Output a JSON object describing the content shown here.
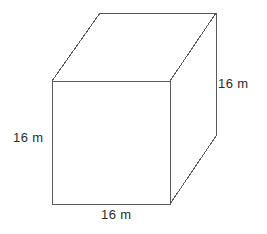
{
  "figure": {
    "kind": "rectangular-prism-diagram",
    "shape_name": "cube",
    "background_color": "#ffffff",
    "line_color": "#5a5a5a",
    "text_color": "#2b2b2b",
    "labels": {
      "height_left": "16 m",
      "depth_right": "16 m",
      "width_bottom": "16 m"
    },
    "geometry": {
      "front_face": [
        [
          52,
          81
        ],
        [
          170,
          81
        ],
        [
          170,
          204
        ],
        [
          52,
          204
        ]
      ],
      "top_back_left": [
        100,
        13
      ],
      "top_back_right": [
        216,
        13
      ],
      "right_back_bottom": [
        216,
        136
      ],
      "top_face": [
        [
          52,
          81
        ],
        [
          100,
          13
        ],
        [
          216,
          13
        ],
        [
          170,
          81
        ]
      ],
      "right_face": [
        [
          170,
          81
        ],
        [
          216,
          13
        ],
        [
          216,
          136
        ],
        [
          170,
          204
        ]
      ]
    }
  }
}
